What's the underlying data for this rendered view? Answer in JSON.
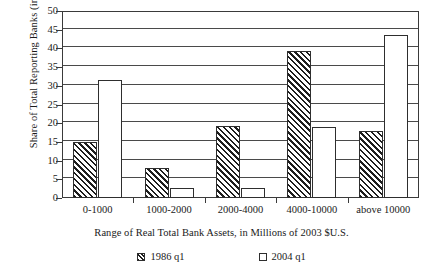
{
  "chart_data": {
    "type": "bar",
    "title": "",
    "xlabel": "Range of Real Total Bank Assets, in Millions of 2003 $U.S.",
    "ylabel": "Share of Total Reporting Banks (in %)",
    "categories": [
      "0-1000",
      "1000-2000",
      "2000-4000",
      "4000-10000",
      "above 10000"
    ],
    "series": [
      {
        "name": "1986 q1",
        "values": [
          15.0,
          8.0,
          19.3,
          39.4,
          17.8
        ]
      },
      {
        "name": "2004 q1",
        "values": [
          31.5,
          2.7,
          2.6,
          19.0,
          43.5
        ]
      }
    ],
    "ylim": [
      0,
      50
    ],
    "ytick_labels": [
      "0",
      "5",
      "10",
      "15",
      "20",
      "25",
      "30",
      "35",
      "40",
      "45",
      "50"
    ],
    "ytick_values": [
      0,
      5,
      10,
      15,
      20,
      25,
      30,
      35,
      40,
      45,
      50
    ],
    "grid": "horizontal",
    "legend_position": "bottom",
    "colors": {
      "series_1986_fill": "#ffffff",
      "series_1986_hatch": "#1e1e1e",
      "series_2004_fill": "#ffffff",
      "bar_outline": "#2e2e2e",
      "gridline": "#4a4a4a",
      "axis": "#3a3a3a",
      "background": "#ffffff",
      "text": "#1a1a1a"
    }
  }
}
